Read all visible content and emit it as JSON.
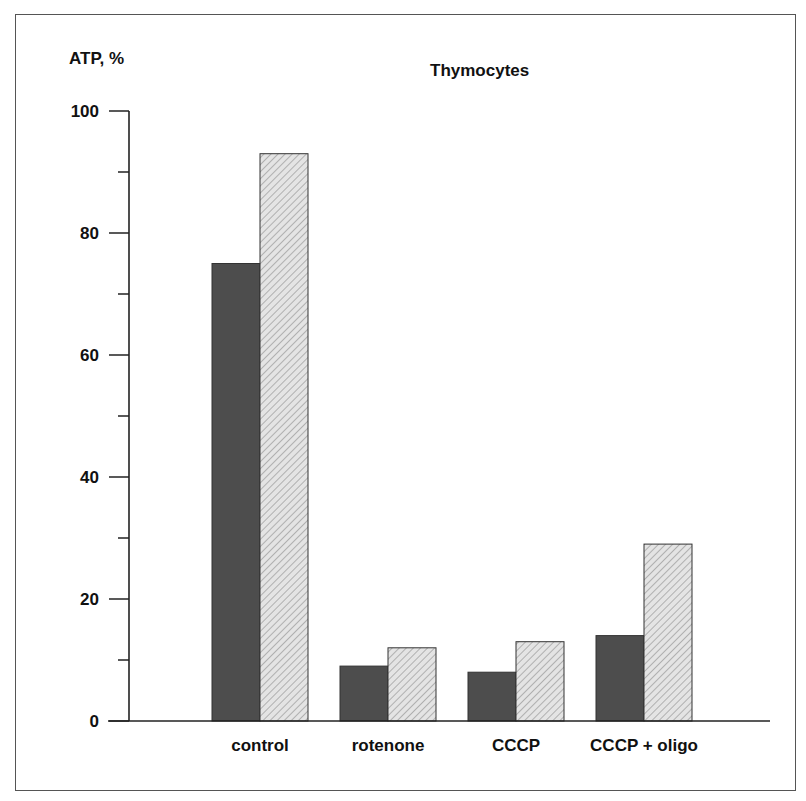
{
  "chart_data": {
    "type": "bar",
    "title": "Thymocytes",
    "ylabel": "ATP, %",
    "xlabel": "",
    "ylim": [
      0,
      100
    ],
    "yticks": [
      0,
      20,
      40,
      60,
      80,
      100
    ],
    "minor_ticks": [
      10,
      30,
      50,
      70,
      90
    ],
    "grid": false,
    "legend": null,
    "categories": [
      "control",
      "rotenone",
      "CCCP",
      "CCCP + oligo"
    ],
    "series": [
      {
        "name": "series 1 (dark solid)",
        "color": "#4a4a4a",
        "values": [
          75,
          9,
          8,
          14
        ]
      },
      {
        "name": "series 2 (light hatched)",
        "color": "#d9d9d9",
        "values": [
          93,
          12,
          13,
          29
        ]
      }
    ]
  }
}
